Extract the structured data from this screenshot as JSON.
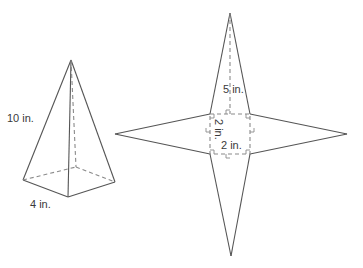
{
  "figure": {
    "pyramid": {
      "slant_label": "10 in.",
      "base_label": "4 in."
    },
    "net": {
      "height_label": "5 in.",
      "side_label_vertical": "2 in.",
      "side_label_horizontal": "2 in."
    },
    "colors": {
      "line": "#555555",
      "dashed": "#8a8a8a",
      "text": "#3a3a3a"
    }
  }
}
